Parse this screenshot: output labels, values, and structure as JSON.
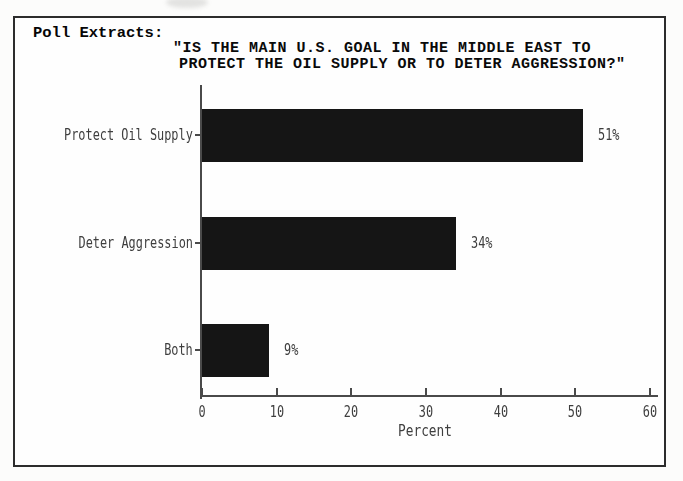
{
  "header": {
    "label": "Poll Extracts:"
  },
  "chart_data": {
    "type": "bar",
    "orientation": "horizontal",
    "title": "\"IS THE MAIN U.S. GOAL IN THE MIDDLE EAST TO PROTECT THE OIL SUPPLY OR TO DETER AGGRESSION?\"",
    "title_lines": [
      "\"IS THE MAIN U.S. GOAL IN THE MIDDLE EAST TO",
      "PROTECT THE OIL SUPPLY OR TO DETER AGGRESSION?\""
    ],
    "categories": [
      "Protect Oil Supply",
      "Deter Aggression",
      "Both"
    ],
    "values": [
      51,
      34,
      9
    ],
    "value_labels": [
      "51%",
      "34%",
      "9%"
    ],
    "xlabel": "Percent",
    "ylabel": "",
    "xticks": [
      "0",
      "10",
      "20",
      "30",
      "40",
      "50",
      "60"
    ],
    "xlim": [
      0,
      60
    ],
    "grid": false,
    "legend": false,
    "bar_color": "#151515",
    "axis_color": "#4a4a4a",
    "text_color": "#3e3e3e"
  }
}
